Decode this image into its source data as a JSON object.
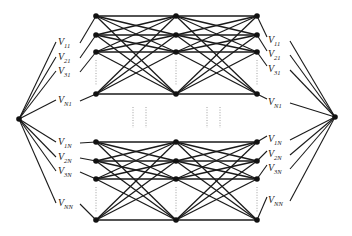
{
  "diagram": {
    "type": "layered-network",
    "hubs": [
      {
        "id": "left-hub",
        "x": 19,
        "y": 119
      },
      {
        "id": "right-hub",
        "x": 335,
        "y": 117
      }
    ],
    "columns_x": [
      96,
      176,
      257
    ],
    "groups": [
      {
        "id": "top-group",
        "rows_y": [
          16,
          35,
          52,
          94
        ]
      },
      {
        "id": "bottom-group",
        "rows_y": [
          142,
          161,
          179,
          220
        ]
      }
    ],
    "left_labels": [
      {
        "main": "V",
        "sub": "11",
        "x": 58,
        "y": 45,
        "row": 0,
        "group": 0
      },
      {
        "main": "V",
        "sub": "21",
        "x": 58,
        "y": 60,
        "row": 1,
        "group": 0
      },
      {
        "main": "V",
        "sub": "31",
        "x": 58,
        "y": 74,
        "row": 2,
        "group": 0
      },
      {
        "main": "V",
        "sub": "N1",
        "x": 58,
        "y": 103,
        "row": 3,
        "group": 0
      },
      {
        "main": "V",
        "sub": "1N",
        "x": 58,
        "y": 145,
        "row": 0,
        "group": 1
      },
      {
        "main": "V",
        "sub": "2N",
        "x": 58,
        "y": 160,
        "row": 1,
        "group": 1
      },
      {
        "main": "V",
        "sub": "3N",
        "x": 58,
        "y": 174,
        "row": 2,
        "group": 1
      },
      {
        "main": "V",
        "sub": "NN",
        "x": 58,
        "y": 206,
        "row": 3,
        "group": 1
      }
    ],
    "right_labels": [
      {
        "main": "V",
        "sub": "11",
        "x": 268,
        "y": 43,
        "row": 0,
        "group": 0
      },
      {
        "main": "V",
        "sub": "21",
        "x": 268,
        "y": 57,
        "row": 1,
        "group": 0
      },
      {
        "main": "V",
        "sub": "31",
        "x": 268,
        "y": 72,
        "row": 2,
        "group": 0
      },
      {
        "main": "V",
        "sub": "N1",
        "x": 268,
        "y": 105,
        "row": 3,
        "group": 0
      },
      {
        "main": "V",
        "sub": "1N",
        "x": 268,
        "y": 142,
        "row": 0,
        "group": 1
      },
      {
        "main": "V",
        "sub": "2N",
        "x": 268,
        "y": 157,
        "row": 1,
        "group": 1
      },
      {
        "main": "V",
        "sub": "3N",
        "x": 268,
        "y": 171,
        "row": 2,
        "group": 1
      },
      {
        "main": "V",
        "sub": "NN",
        "x": 268,
        "y": 203,
        "row": 3,
        "group": 1
      }
    ],
    "ellipsis_x": [
      133,
      146,
      207,
      220
    ],
    "ellipsis_y": [
      107,
      128
    ]
  }
}
